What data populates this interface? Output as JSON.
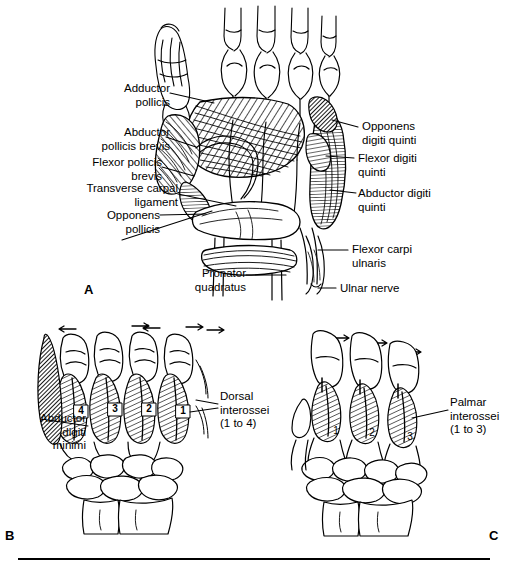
{
  "figure": {
    "background_color": "#ffffff",
    "ink_color": "#000000",
    "width": 509,
    "height": 569
  },
  "panels": [
    {
      "id": "A",
      "letter": "A",
      "caption": "Palmar view of the deep muscles of the hand"
    },
    {
      "id": "B",
      "letter": "B",
      "caption": "Dorsal interossei, abduction of digits"
    },
    {
      "id": "C",
      "letter": "C",
      "caption": "Palmar interossei, adduction of digits"
    }
  ],
  "panel_a": {
    "labels_left": [
      {
        "key": "adductor_pollicis",
        "text": "Adductor\npollicis"
      },
      {
        "key": "abductor_pollicis_brevis",
        "text": "Abductor\npollicis brevis"
      },
      {
        "key": "flexor_pollicis_brevis",
        "text": "Flexor pollicis\nbrevis"
      },
      {
        "key": "transverse_carpal_ligament",
        "text": "Transverse carpal\nligament"
      },
      {
        "key": "opponens_pollicis",
        "text": "Opponens\npollicis"
      },
      {
        "key": "pronator_quadratus",
        "text": "Pronator\nquadratus"
      }
    ],
    "labels_right": [
      {
        "key": "opponens_digiti_quinti",
        "text": "Opponens\ndigiti quinti"
      },
      {
        "key": "flexor_digiti_quinti",
        "text": "Flexor digiti\nquinti"
      },
      {
        "key": "abductor_digiti_quinti",
        "text": "Abductor digiti\nquinti"
      },
      {
        "key": "flexor_carpi_ulnaris",
        "text": "Flexor carpi\nulnaris"
      },
      {
        "key": "ulnar_nerve",
        "text": "Ulnar nerve"
      }
    ]
  },
  "panel_b": {
    "labels": [
      {
        "key": "abductor_digiti_minimi",
        "text": "Abductor\ndigiti\nminimi"
      },
      {
        "key": "dorsal_interossei",
        "text": "Dorsal\ninterossei\n(1 to 4)"
      }
    ],
    "muscle_numbers": [
      "4",
      "3",
      "2",
      "1"
    ],
    "arrow_count": 5,
    "arrow_direction": "bidirectional-abduction"
  },
  "panel_c": {
    "labels": [
      {
        "key": "palmar_interossei",
        "text": "Palmar\ninterossei\n(1 to 3)"
      }
    ],
    "muscle_numbers": [
      "1",
      "2",
      "3"
    ],
    "arrow_count": 3,
    "arrow_direction": "right-adduction"
  }
}
